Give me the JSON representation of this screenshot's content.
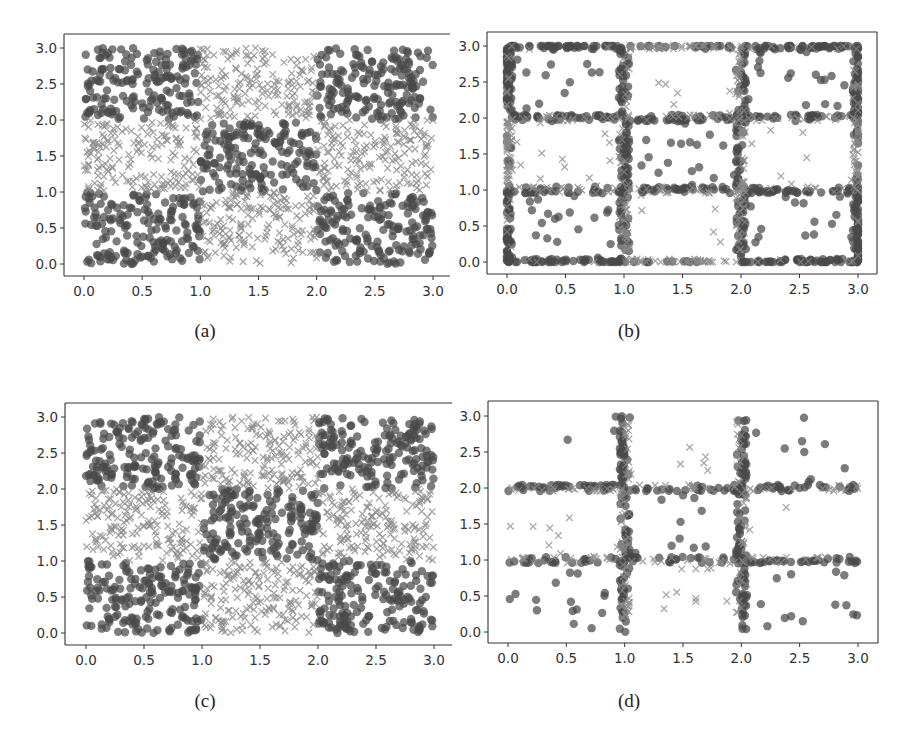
{
  "figure": {
    "captions": [
      "(a)",
      "(b)",
      "(c)",
      "(d)"
    ]
  },
  "chart_data": [
    {
      "id": "a",
      "type": "scatter",
      "title": "",
      "caption": "(a)",
      "xlabel": "",
      "ylabel": "",
      "xlim": [
        -0.18,
        3.15
      ],
      "ylim": [
        -0.15,
        3.2
      ],
      "xticks": [
        "0.0",
        "0.5",
        "1.0",
        "1.5",
        "2.0",
        "2.5",
        "3.0"
      ],
      "yticks": [
        "0.0",
        "0.5",
        "1.0",
        "1.5",
        "2.0",
        "2.5",
        "3.0"
      ],
      "grid": false,
      "legend": null,
      "pattern": "checkerboard 3x3 uniform samples",
      "series": [
        {
          "name": "class 0",
          "marker": "circle",
          "color": "#4a4a4a",
          "cells": [
            [
              0,
              0
            ],
            [
              0,
              2
            ],
            [
              1,
              1
            ],
            [
              2,
              0
            ],
            [
              2,
              2
            ]
          ],
          "count_per_cell": 170
        },
        {
          "name": "class 1",
          "marker": "x",
          "color": "#8a8a8a",
          "cells": [
            [
              1,
              0
            ],
            [
              0,
              1
            ],
            [
              1,
              2
            ],
            [
              2,
              1
            ]
          ],
          "count_per_cell": 170
        }
      ]
    },
    {
      "id": "b",
      "type": "scatter",
      "title": "",
      "caption": "(b)",
      "xlabel": "",
      "ylabel": "",
      "xlim": [
        -0.18,
        3.15
      ],
      "ylim": [
        -0.15,
        3.2
      ],
      "xticks": [
        "0.0",
        "0.5",
        "1.0",
        "1.5",
        "2.0",
        "2.5",
        "3.0"
      ],
      "yticks": [
        "0.0",
        "0.5",
        "1.0",
        "1.5",
        "2.0",
        "2.5",
        "3.0"
      ],
      "grid": false,
      "legend": null,
      "pattern": "samples concentrated on grid lines x,y in {0,1,2,3} with sparse interior",
      "series": [
        {
          "name": "class 0",
          "marker": "circle",
          "color": "#4a4a4a",
          "cells": [
            [
              0,
              0
            ],
            [
              0,
              2
            ],
            [
              1,
              1
            ],
            [
              2,
              0
            ],
            [
              2,
              2
            ]
          ],
          "line_count": 900,
          "interior_count": 90
        },
        {
          "name": "class 1",
          "marker": "x",
          "color": "#8a8a8a",
          "cells": [
            [
              1,
              0
            ],
            [
              0,
              1
            ],
            [
              1,
              2
            ],
            [
              2,
              1
            ]
          ],
          "line_count": 420,
          "interior_count": 40
        }
      ]
    },
    {
      "id": "c",
      "type": "scatter",
      "title": "",
      "caption": "(c)",
      "xlabel": "",
      "ylabel": "",
      "xlim": [
        -0.18,
        3.15
      ],
      "ylim": [
        -0.15,
        3.2
      ],
      "xticks": [
        "0.0",
        "0.5",
        "1.0",
        "1.5",
        "2.0",
        "2.5",
        "3.0"
      ],
      "yticks": [
        "0.0",
        "0.5",
        "1.0",
        "1.5",
        "2.0",
        "2.5",
        "3.0"
      ],
      "grid": false,
      "legend": null,
      "pattern": "checkerboard 3x3 uniform samples",
      "series": [
        {
          "name": "class 0",
          "marker": "circle",
          "color": "#4a4a4a",
          "cells": [
            [
              0,
              0
            ],
            [
              0,
              2
            ],
            [
              1,
              1
            ],
            [
              2,
              0
            ],
            [
              2,
              2
            ]
          ],
          "count_per_cell": 175
        },
        {
          "name": "class 1",
          "marker": "x",
          "color": "#8a8a8a",
          "cells": [
            [
              1,
              0
            ],
            [
              0,
              1
            ],
            [
              1,
              2
            ],
            [
              2,
              1
            ]
          ],
          "count_per_cell": 175
        }
      ]
    },
    {
      "id": "d",
      "type": "scatter",
      "title": "",
      "caption": "(d)",
      "xlabel": "",
      "ylabel": "",
      "xlim": [
        -0.18,
        3.15
      ],
      "ylim": [
        -0.15,
        3.2
      ],
      "xticks": [
        "0.0",
        "0.5",
        "1.0",
        "1.5",
        "2.0",
        "2.5",
        "3.0"
      ],
      "yticks": [
        "0.0",
        "0.5",
        "1.0",
        "1.5",
        "2.0",
        "2.5",
        "3.0"
      ],
      "grid": false,
      "legend": null,
      "pattern": "samples concentrated on interior grid lines x,y in {1,2} with sparse interior",
      "series": [
        {
          "name": "class 0",
          "marker": "circle",
          "color": "#4a4a4a",
          "cells": [
            [
              0,
              0
            ],
            [
              0,
              2
            ],
            [
              1,
              1
            ],
            [
              2,
              0
            ],
            [
              2,
              2
            ]
          ],
          "line_count": 380,
          "interior_count": 55
        },
        {
          "name": "class 1",
          "marker": "x",
          "color": "#8a8a8a",
          "cells": [
            [
              1,
              0
            ],
            [
              0,
              1
            ],
            [
              1,
              2
            ],
            [
              2,
              1
            ]
          ],
          "line_count": 200,
          "interior_count": 35
        }
      ]
    }
  ],
  "layout": {
    "panels": [
      {
        "id": "a",
        "box": [
          64,
          34,
          450,
          276
        ],
        "x0px": 84,
        "x3px": 433,
        "y3px": 48,
        "y0px": 264,
        "open_right": true,
        "caption_xy": [
          205,
          330
        ]
      },
      {
        "id": "b",
        "box": [
          487,
          32,
          877,
          274
        ],
        "x0px": 507,
        "x3px": 858,
        "y3px": 46,
        "y0px": 262,
        "open_right": false,
        "caption_xy": [
          630,
          330
        ]
      },
      {
        "id": "c",
        "box": [
          65,
          403,
          452,
          645
        ],
        "x0px": 86,
        "x3px": 434,
        "y3px": 417,
        "y0px": 633,
        "open_right": true,
        "caption_xy": [
          205,
          700
        ]
      },
      {
        "id": "d",
        "box": [
          488,
          401,
          878,
          643
        ],
        "x0px": 508,
        "x3px": 858,
        "y3px": 416,
        "y0px": 632,
        "open_right": false,
        "caption_xy": [
          630,
          700
        ]
      }
    ]
  }
}
